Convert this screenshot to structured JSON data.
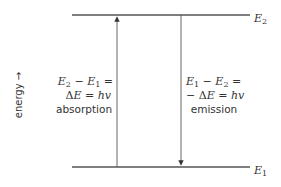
{
  "diagram": {
    "type": "energy-level-diagram",
    "axis_label": "energy →",
    "levels": [
      {
        "id": "upper",
        "label_main": "E",
        "label_sub": "2",
        "y": 15
      },
      {
        "id": "lower",
        "label_main": "E",
        "label_sub": "1",
        "y": 167
      }
    ],
    "transitions": [
      {
        "id": "absorption",
        "direction": "up",
        "line1": {
          "a": "E",
          "a_sub": "2",
          "op": " − ",
          "b": "E",
          "b_sub": "1",
          "tail": " ="
        },
        "line2": {
          "pre": "",
          "delta": "Δ",
          "e": "E",
          "eq": " = ",
          "h": "hv"
        },
        "line3": "absorption"
      },
      {
        "id": "emission",
        "direction": "down",
        "line1": {
          "a": "E",
          "a_sub": "1",
          "op": " − ",
          "b": "E",
          "b_sub": "2",
          "tail": " ="
        },
        "line2": {
          "pre": "− ",
          "delta": "Δ",
          "e": "E",
          "eq": " = ",
          "h": "hv"
        },
        "line3": "emission"
      }
    ],
    "colors": {
      "line": "#555555",
      "text": "#333333"
    }
  }
}
